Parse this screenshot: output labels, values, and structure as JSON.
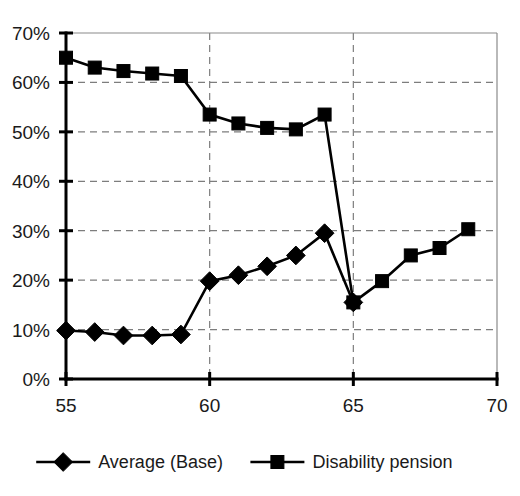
{
  "chart_data": {
    "type": "line",
    "title": "",
    "subtitle": "",
    "xlabel": "",
    "ylabel": "",
    "xlim": [
      55,
      70
    ],
    "ylim": [
      0,
      0.7
    ],
    "x_ticks": [
      55,
      60,
      65,
      70
    ],
    "x_tick_labels": [
      "55",
      "60",
      "65",
      "70"
    ],
    "y_ticks": [
      0,
      0.1,
      0.2,
      0.3,
      0.4,
      0.5,
      0.6,
      0.7
    ],
    "y_tick_labels": [
      "0%",
      "10%",
      "20%",
      "30%",
      "40%",
      "50%",
      "60%",
      "70%"
    ],
    "grid": true,
    "grid_axis": "both",
    "legend_position": "bottom",
    "series": [
      {
        "name": "Average (Base)",
        "marker": "diamond",
        "color": "#000000",
        "x": [
          55,
          56,
          57,
          58,
          59,
          60,
          61,
          62,
          63,
          64,
          65
        ],
        "values": [
          0.098,
          0.095,
          0.088,
          0.088,
          0.09,
          0.198,
          0.21,
          0.228,
          0.25,
          0.295,
          0.155
        ]
      },
      {
        "name": "Disability pension",
        "marker": "square",
        "color": "#000000",
        "x": [
          55,
          56,
          57,
          58,
          59,
          60,
          61,
          62,
          63,
          64,
          65,
          66,
          67,
          68,
          69
        ],
        "values": [
          0.65,
          0.63,
          0.623,
          0.618,
          0.613,
          0.535,
          0.517,
          0.508,
          0.505,
          0.535,
          0.155,
          0.198,
          0.25,
          0.265,
          0.303
        ]
      }
    ],
    "legend": [
      {
        "label": "Average (Base)",
        "marker": "diamond"
      },
      {
        "label": "Disability pension",
        "marker": "square"
      }
    ]
  }
}
